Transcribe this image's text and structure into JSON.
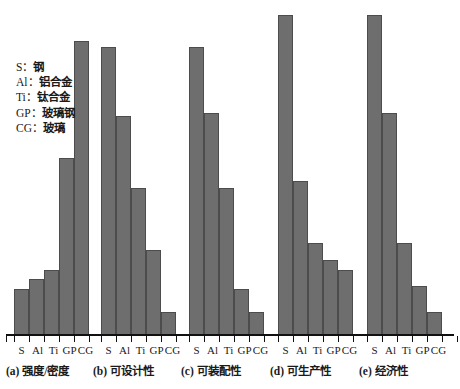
{
  "legend": {
    "title": "",
    "entries": [
      {
        "key": "S",
        "sep": "：",
        "label": "钢"
      },
      {
        "key": "Al",
        "sep": "：",
        "label": "铝合金"
      },
      {
        "key": "Ti",
        "sep": "：",
        "label": "钛合金"
      },
      {
        "key": "GP",
        "sep": "：",
        "label": "玻璃钢"
      },
      {
        "key": "CG",
        "sep": "：",
        "label": "玻璃"
      }
    ]
  },
  "colors": {
    "bar_fill": "#6e6e6e",
    "bar_border": "#4c4c4c",
    "axis": "#111111",
    "text": "#1a1a1a",
    "background": "#ffffff"
  },
  "chart_data": {
    "type": "bar",
    "title": "",
    "xlabel": "",
    "ylabel": "",
    "ylim": [
      0,
      100
    ],
    "grid": false,
    "legend_position": "left-inside",
    "categories": [
      "S",
      "Al",
      "Ti",
      "GP",
      "CG"
    ],
    "category_names": [
      "钢",
      "铝合金",
      "钛合金",
      "玻璃钢",
      "玻璃"
    ],
    "panels": [
      {
        "id": "a",
        "caption": "(a) 强度/密度",
        "ticklabels": [
          "S",
          "Al",
          "Ti",
          "GP",
          "CG"
        ],
        "values": [
          14,
          17,
          20,
          54,
          90
        ]
      },
      {
        "id": "b",
        "caption": "(b) 可设计性",
        "ticklabels": [
          "S",
          "Al",
          "Ti",
          "GP",
          "CG"
        ],
        "values": [
          88,
          67,
          45,
          26,
          7
        ]
      },
      {
        "id": "c",
        "caption": "(c) 可装配性",
        "ticklabels": [
          "S",
          "Al",
          "Ti",
          "GP",
          "CG"
        ],
        "values": [
          88,
          68,
          45,
          14,
          7
        ]
      },
      {
        "id": "d",
        "caption": "(d) 可生产性",
        "ticklabels": [
          "S",
          "Al",
          "Ti",
          "GP",
          "CG"
        ],
        "values": [
          98,
          47,
          28,
          23,
          20
        ]
      },
      {
        "id": "e",
        "caption": "(e) 经济性",
        "ticklabels": [
          "S",
          "Al",
          "Ti",
          "GP",
          "CG"
        ],
        "values": [
          98,
          68,
          28,
          15,
          7
        ]
      }
    ]
  }
}
